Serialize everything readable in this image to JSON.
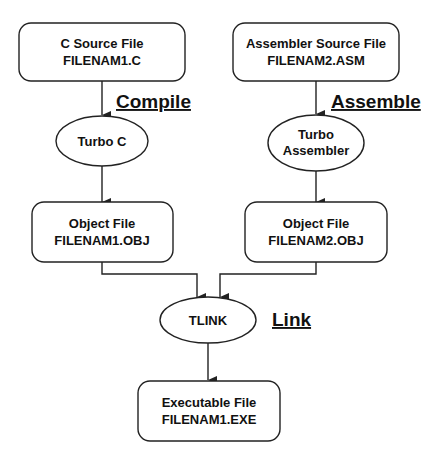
{
  "diagram": {
    "nodes": {
      "c_source": {
        "line1": "C Source File",
        "line2": "FILENAM1.C"
      },
      "asm_source": {
        "line1": "Assembler Source File",
        "line2": "FILENAM2.ASM"
      },
      "turbo_c": {
        "line1": "Turbo C"
      },
      "turbo_asm": {
        "line1": "Turbo",
        "line2": "Assembler"
      },
      "obj1": {
        "line1": "Object File",
        "line2": "FILENAM1.OBJ"
      },
      "obj2": {
        "line1": "Object File",
        "line2": "FILENAM2.OBJ"
      },
      "tlink": {
        "line1": "TLINK"
      },
      "exe": {
        "line1": "Executable File",
        "line2": "FILENAM1.EXE"
      }
    },
    "steps": {
      "compile": "Compile",
      "assemble": "Assemble",
      "link": "Link"
    },
    "colors": {
      "stroke": "#222222",
      "text": "#111111",
      "background": "#ffffff"
    }
  }
}
